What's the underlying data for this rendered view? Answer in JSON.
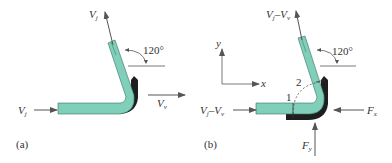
{
  "colors": {
    "fluid": "#7fcfba",
    "fluid_stroke": "#3a6e62",
    "backing": "#1e1e1e",
    "arrow": "#555555",
    "line": "#555555",
    "text": "#333333"
  },
  "panel_a": {
    "label": "(a)",
    "inlet_velocity": {
      "main": "V",
      "sub": "j"
    },
    "outlet_velocity": {
      "main": "V",
      "sub": "j"
    },
    "vane_velocity": {
      "main": "V",
      "sub": "v"
    },
    "angle": "120°"
  },
  "panel_b": {
    "label": "(b)",
    "inlet_relative_velocity": {
      "main1": "V",
      "sub1": "j",
      "dash": "–",
      "main2": "V",
      "sub2": "v"
    },
    "outlet_relative_velocity": {
      "main1": "V",
      "sub1": "j",
      "dash": "–",
      "main2": "V",
      "sub2": "v"
    },
    "force_x": {
      "main": "F",
      "sub": "x"
    },
    "force_y": {
      "main": "F",
      "sub": "y"
    },
    "angle": "120°",
    "section_1": "1",
    "section_2": "2",
    "axis_x": "x",
    "axis_y": "y"
  }
}
